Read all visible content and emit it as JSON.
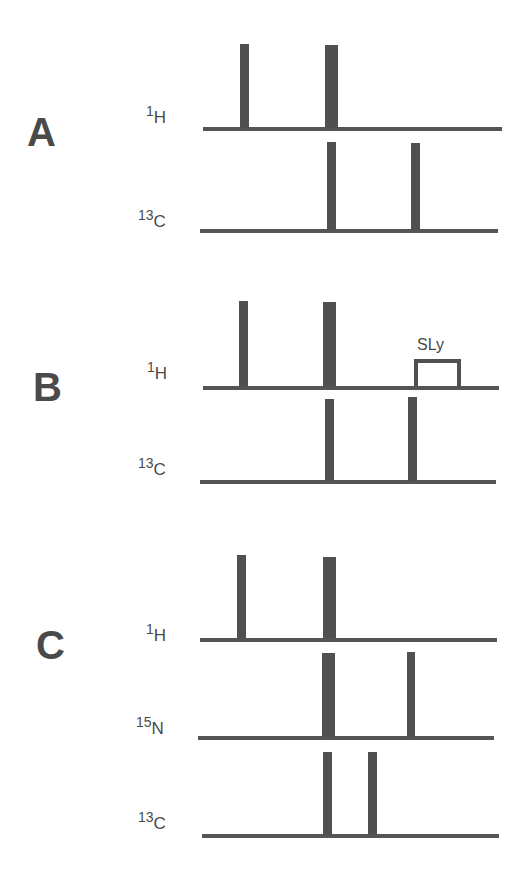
{
  "colors": {
    "ink": "#505050",
    "background": "#ffffff"
  },
  "panels": [
    {
      "label": "A",
      "label_pos": [
        27,
        112
      ],
      "channels": [
        {
          "isotope": "1",
          "element": "H",
          "label_pos": [
            146,
            104
          ],
          "baseline": {
            "x1": 203,
            "x2": 502,
            "y": 127
          },
          "pulses": [
            {
              "x": 240,
              "width": 9,
              "top": 44,
              "kind": "90"
            },
            {
              "x": 325,
              "width": 13,
              "top": 45,
              "kind": "180"
            }
          ]
        },
        {
          "isotope": "13",
          "element": "C",
          "label_pos": [
            138,
            208
          ],
          "baseline": {
            "x1": 200,
            "x2": 498,
            "y": 229
          },
          "pulses": [
            {
              "x": 327,
              "width": 9,
              "top": 142,
              "kind": "90"
            },
            {
              "x": 411,
              "width": 9,
              "top": 143,
              "kind": "90"
            }
          ]
        }
      ]
    },
    {
      "label": "B",
      "label_pos": [
        33,
        367
      ],
      "channels": [
        {
          "isotope": "1",
          "element": "H",
          "label_pos": [
            147,
            360
          ],
          "baseline": {
            "x1": 203,
            "x2": 499,
            "y": 386
          },
          "pulses": [
            {
              "x": 239,
              "width": 9,
              "top": 301,
              "kind": "90"
            },
            {
              "x": 323,
              "width": 13,
              "top": 302,
              "kind": "180"
            }
          ],
          "spinlock": {
            "label": "SLy",
            "x": 414,
            "width": 47,
            "top": 359,
            "label_x": 417,
            "label_y": 337
          }
        },
        {
          "isotope": "13",
          "element": "C",
          "label_pos": [
            138,
            456
          ],
          "baseline": {
            "x1": 200,
            "x2": 496,
            "y": 480
          },
          "pulses": [
            {
              "x": 325,
              "width": 9,
              "top": 399,
              "kind": "90"
            },
            {
              "x": 408,
              "width": 9,
              "top": 397,
              "kind": "90"
            }
          ]
        }
      ]
    },
    {
      "label": "C",
      "label_pos": [
        36,
        625
      ],
      "channels": [
        {
          "isotope": "1",
          "element": "H",
          "label_pos": [
            146,
            622
          ],
          "baseline": {
            "x1": 200,
            "x2": 497,
            "y": 638
          },
          "pulses": [
            {
              "x": 237,
              "width": 9,
              "top": 555,
              "kind": "90"
            },
            {
              "x": 323,
              "width": 13,
              "top": 557,
              "kind": "180"
            }
          ]
        },
        {
          "isotope": "15",
          "element": "N",
          "label_pos": [
            136,
            715
          ],
          "baseline": {
            "x1": 198,
            "x2": 494,
            "y": 736
          },
          "pulses": [
            {
              "x": 322,
              "width": 13,
              "top": 653,
              "kind": "180"
            },
            {
              "x": 407,
              "width": 8,
              "top": 652,
              "kind": "90"
            }
          ]
        },
        {
          "isotope": "13",
          "element": "C",
          "label_pos": [
            138,
            810
          ],
          "baseline": {
            "x1": 202,
            "x2": 499,
            "y": 834
          },
          "pulses": [
            {
              "x": 323,
              "width": 9,
              "top": 752,
              "kind": "90"
            },
            {
              "x": 368,
              "width": 9,
              "top": 752,
              "kind": "90"
            }
          ]
        }
      ]
    }
  ]
}
